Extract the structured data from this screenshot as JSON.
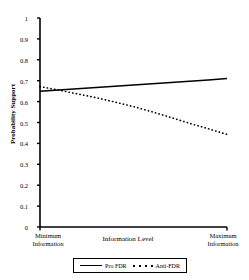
{
  "chart_data": {
    "type": "line",
    "title": "",
    "xlabel": "Information Level",
    "ylabel": "Probability Support",
    "xlim": [
      0,
      1
    ],
    "ylim": [
      0,
      1
    ],
    "grid": false,
    "legend_position": "bottom",
    "x_tick_labels": [
      "Minimum Information",
      "Maximum Information"
    ],
    "y_tick_labels": [
      "0",
      "0.1",
      "0.2",
      "0.3",
      "0.4",
      "0.5",
      "0.6",
      "0.7",
      "0.8",
      "0.9",
      "1"
    ],
    "y_tick_values": [
      0,
      0.1,
      0.2,
      0.3,
      0.4,
      0.5,
      0.6,
      0.7,
      0.8,
      0.9,
      1
    ],
    "series": [
      {
        "name": "Pro FDR",
        "style": "solid",
        "color": "#000000",
        "x": [
          0,
          0.1,
          0.2,
          0.3,
          0.4,
          0.5,
          0.6,
          0.7,
          0.8,
          0.9,
          1
        ],
        "values": [
          0.649,
          0.655,
          0.661,
          0.667,
          0.673,
          0.679,
          0.685,
          0.691,
          0.697,
          0.703,
          0.711
        ]
      },
      {
        "name": "Anti-FDR",
        "style": "dotted",
        "color": "#000000",
        "x": [
          0,
          0.1,
          0.2,
          0.3,
          0.4,
          0.5,
          0.6,
          0.7,
          0.8,
          0.9,
          1
        ],
        "values": [
          0.672,
          0.655,
          0.637,
          0.619,
          0.598,
          0.576,
          0.551,
          0.524,
          0.496,
          0.47,
          0.443
        ]
      }
    ]
  },
  "axis": {
    "y_label": "Probability Support",
    "x_label": "Information Level",
    "x_left_line1": "Minimum",
    "x_left_line2": "Information",
    "x_right_line1": "Maximum",
    "x_right_line2": "Information",
    "y_ticks": {
      "t10": "1",
      "t9": "0.9",
      "t8": "0.8",
      "t7": "0.7",
      "t6": "0.6",
      "t5": "0.5",
      "t4": "0.4",
      "t3": "0.3",
      "t2": "0.2",
      "t1": "0.1",
      "t0": "0"
    }
  },
  "legend": {
    "entry_solid": "Pro FDR",
    "entry_dotted": "Anti-FDR"
  },
  "colors": {
    "line": "#000000",
    "axis": "#000000",
    "background": "#ffffff"
  }
}
